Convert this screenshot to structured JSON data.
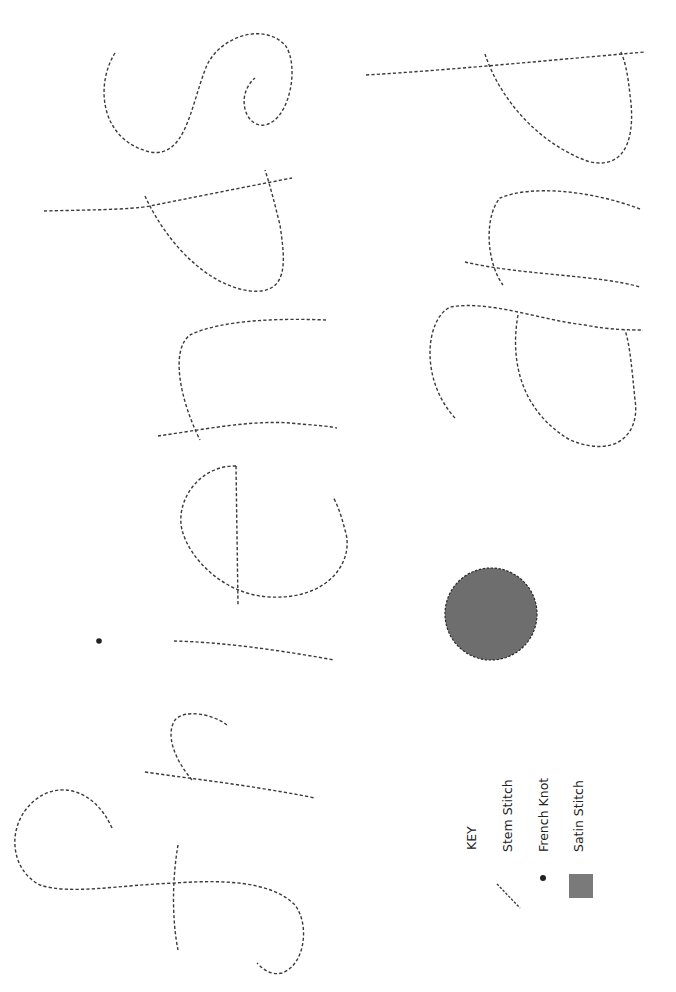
{
  "pattern": {
    "words": [
      "friends",
      "and"
    ],
    "stitch_color": "#3a3a3a",
    "satin_fill": "#6e6e6e",
    "orientation": "rotated 90deg clockwise"
  },
  "key": {
    "title": "KEY",
    "items": [
      {
        "label": "Stem Stitch",
        "icon": "dashed-line-icon"
      },
      {
        "label": "French Knot",
        "icon": "dot-icon"
      },
      {
        "label": "Satin Stitch",
        "icon": "filled-square-icon",
        "color": "#7a7a7a"
      }
    ]
  }
}
